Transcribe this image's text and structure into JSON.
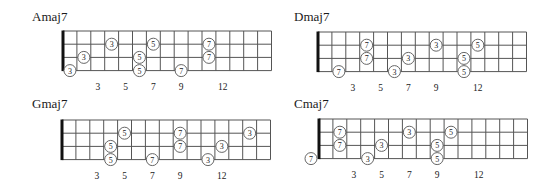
{
  "layout": {
    "fret_count": 15,
    "string_count": 4,
    "fret_spacing": 13.9,
    "string_spacing": 13.2,
    "dot_radius": 6,
    "line_color": "#555555",
    "nut_color": "#111111",
    "dot_stroke": "#666666",
    "dot_fill": "#ffffff"
  },
  "fret_markers": [
    {
      "fret": 3,
      "label": "3"
    },
    {
      "fret": 5,
      "label": "5"
    },
    {
      "fret": 7,
      "label": "7"
    },
    {
      "fret": 9,
      "label": "9"
    },
    {
      "fret": 12,
      "label": "12"
    }
  ],
  "diagrams": [
    {
      "id": "amaj7",
      "title": "Amaj7",
      "title_pos": [
        32,
        9
      ],
      "nut_x": 63,
      "top_y": 31,
      "dots": [
        {
          "string": 4,
          "fret": 1,
          "label": "3"
        },
        {
          "string": 3,
          "fret": 2,
          "label": "3"
        },
        {
          "string": 2,
          "fret": 4,
          "label": "3"
        },
        {
          "string": 3,
          "fret": 6,
          "label": "5"
        },
        {
          "string": 4,
          "fret": 6,
          "label": "5"
        },
        {
          "string": 2,
          "fret": 7,
          "label": "5"
        },
        {
          "string": 4,
          "fret": 9,
          "label": "7"
        },
        {
          "string": 2,
          "fret": 11,
          "label": "7"
        },
        {
          "string": 3,
          "fret": 11,
          "label": "7"
        }
      ]
    },
    {
      "id": "dmaj7",
      "title": "Dmaj7",
      "title_pos": [
        294,
        9
      ],
      "nut_x": 318,
      "top_y": 32,
      "dots": [
        {
          "string": 4,
          "fret": 2,
          "label": "7"
        },
        {
          "string": 2,
          "fret": 4,
          "label": "7"
        },
        {
          "string": 3,
          "fret": 4,
          "label": "7"
        },
        {
          "string": 4,
          "fret": 6,
          "label": "3"
        },
        {
          "string": 3,
          "fret": 7,
          "label": "3"
        },
        {
          "string": 2,
          "fret": 9,
          "label": "3"
        },
        {
          "string": 3,
          "fret": 11,
          "label": "5"
        },
        {
          "string": 4,
          "fret": 11,
          "label": "5"
        },
        {
          "string": 2,
          "fret": 12,
          "label": "5"
        }
      ]
    },
    {
      "id": "gmaj7",
      "title": "Gmaj7",
      "title_pos": [
        32,
        96
      ],
      "nut_x": 62,
      "top_y": 120,
      "dots": [
        {
          "string": 3,
          "fret": 4,
          "label": "5"
        },
        {
          "string": 4,
          "fret": 4,
          "label": "5"
        },
        {
          "string": 2,
          "fret": 5,
          "label": "5"
        },
        {
          "string": 4,
          "fret": 7,
          "label": "7"
        },
        {
          "string": 2,
          "fret": 9,
          "label": "7"
        },
        {
          "string": 3,
          "fret": 9,
          "label": "7"
        },
        {
          "string": 4,
          "fret": 11,
          "label": "3"
        },
        {
          "string": 3,
          "fret": 12,
          "label": "3"
        },
        {
          "string": 2,
          "fret": 14,
          "label": "3"
        }
      ]
    },
    {
      "id": "cmaj7",
      "title": "Cmaj7",
      "title_pos": [
        294,
        96
      ],
      "nut_x": 319,
      "top_y": 119,
      "dots": [
        {
          "string": 4,
          "fret": 0,
          "label": "7"
        },
        {
          "string": 2,
          "fret": 2,
          "label": "7"
        },
        {
          "string": 3,
          "fret": 2,
          "label": "7"
        },
        {
          "string": 4,
          "fret": 4,
          "label": "3"
        },
        {
          "string": 3,
          "fret": 5,
          "label": "3"
        },
        {
          "string": 2,
          "fret": 7,
          "label": "3"
        },
        {
          "string": 3,
          "fret": 9,
          "label": "5"
        },
        {
          "string": 4,
          "fret": 9,
          "label": "5"
        },
        {
          "string": 2,
          "fret": 10,
          "label": "5"
        }
      ]
    }
  ]
}
